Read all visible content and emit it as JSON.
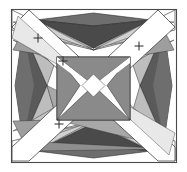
{
  "figure": {
    "type": "geometric-line-diagram",
    "width": 187,
    "height": 172,
    "background_color": "#ffffff"
  },
  "palette": {
    "white": "#ffffff",
    "very_light_gray": "#f2f2f2",
    "light_gray": "#d6d6d6",
    "mid_light_gray": "#bdbdbd",
    "mid_gray": "#9e9e9e",
    "mid_dark_gray": "#8a8a8a",
    "dark_gray": "#6b6b6b",
    "darker_gray": "#555555",
    "near_black": "#3d3d3d",
    "stroke": "#1a1a1a",
    "frame_stroke": "#4a4a4a"
  },
  "frame": {
    "name": "outer-square-border",
    "x": 11,
    "y": 9,
    "width": 165,
    "height": 153,
    "stroke_width": 1.1
  },
  "inner_square": {
    "name": "inner-square-border",
    "x": 57,
    "y": 57,
    "width": 73,
    "height": 63,
    "stroke_width": 1.0
  },
  "markers": {
    "glyph": "+",
    "size": 9,
    "stroke_width": 1.0,
    "color": "#2b2b2b",
    "points": [
      {
        "id": "marker-1",
        "x": 38,
        "y": 38
      },
      {
        "id": "marker-2",
        "x": 63,
        "y": 61
      },
      {
        "id": "marker-3",
        "x": 139,
        "y": 46
      },
      {
        "id": "marker-4",
        "x": 59,
        "y": 124
      }
    ]
  },
  "shapes": {
    "top_kite": {
      "name": "top-dark-kite",
      "fill": "#555555",
      "points": "35,20 93.5,14 152,20 93.5,44"
    },
    "top_kite_lower": {
      "name": "top-kite-lower-lobe",
      "fill": "#3d3d3d",
      "points": "35,20 93.5,44 152,20 93.5,50 "
    },
    "bottom_kite": {
      "name": "bottom-dark-kite",
      "fill": "#555555",
      "points": "35,150 93.5,157 152,150 93.5,128"
    },
    "bottom_kite_upper": {
      "name": "bottom-kite-upper-lobe",
      "fill": "#3d3d3d",
      "points": "35,150 93.5,128 152,150 93.5,122"
    },
    "left_lens": {
      "name": "left-dark-lens",
      "fill": "#555555",
      "points": "22,30 46,85.5 22,141 14,85.5"
    },
    "right_lens": {
      "name": "right-dark-lens",
      "fill": "#555555",
      "points": "165,30 141,85.5 165,141 173,85.5"
    },
    "center_left_wing": {
      "name": "center-left-wing",
      "fill": "#8a8a8a",
      "points": "57,57 93.5,85.5 57,120"
    },
    "center_right_wing": {
      "name": "center-right-wing",
      "fill": "#8a8a8a",
      "points": "130,57 93.5,85.5 130,120"
    },
    "center_top_wing": {
      "name": "center-top-wing",
      "fill": "#8a8a8a",
      "points": "57,57 93.5,85.5 130,57"
    },
    "center_bottom_wing": {
      "name": "center-bottom-wing",
      "fill": "#8a8a8a",
      "points": "57,120 93.5,85.5 130,120"
    },
    "diagonal_band_main": {
      "name": "main-diagonal-white-band",
      "fill": "#ffffff",
      "points": "11,26 28,9 176,148 176,162 159,162"
    },
    "diagonal_band_anti": {
      "name": "anti-diagonal-white-band",
      "fill": "#ffffff",
      "points": "176,26 159,9 11,148 11,162 28,162"
    }
  },
  "fan_rays": {
    "name": "corner-fan-rays",
    "description": "Long thin wedges radiating between corners and the inner square, in alternating gray tones",
    "tones": [
      "#d6d6d6",
      "#bdbdbd",
      "#9e9e9e",
      "#8a8a8a",
      "#6b6b6b",
      "#f2f2f2"
    ]
  },
  "labels": {
    "alt_text": "Symmetric four-fold geometric crease pattern with dark kite shapes at top and bottom, dark lens shapes at left and right, a central X-shaped butterfly motif inside a square, crossing diagonal white bands, and four small plus-sign registration marks"
  }
}
